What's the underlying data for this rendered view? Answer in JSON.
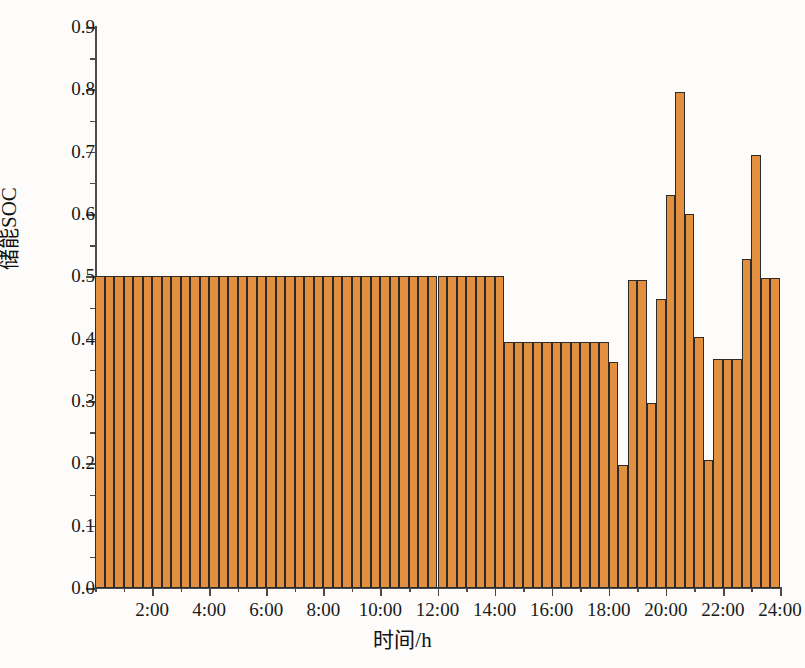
{
  "chart_data": {
    "type": "bar",
    "title": "",
    "xlabel": "时间/h",
    "ylabel": "储能SOC",
    "xlim": [
      0,
      24
    ],
    "ylim": [
      0.0,
      0.9
    ],
    "grid": false,
    "legend": null,
    "bar_color": "#e2903f",
    "bar_edge_color": "#2b2b2b",
    "axis_color": "#4a4a4a",
    "y_major_ticks": [
      "0.0",
      "0.1",
      "0.2",
      "0.3",
      "0.4",
      "0.5",
      "0.6",
      "0.7",
      "0.8",
      "0.9"
    ],
    "y_major_values": [
      0.0,
      0.1,
      0.2,
      0.3,
      0.4,
      0.5,
      0.6,
      0.7,
      0.8,
      0.9
    ],
    "y_minor_step": 0.05,
    "x_major_ticks": [
      "2:00",
      "4:00",
      "6:00",
      "8:00",
      "10:00",
      "12:00",
      "14:00",
      "16:00",
      "18:00",
      "20:00",
      "22:00",
      "24:00"
    ],
    "x_major_values": [
      2,
      4,
      6,
      8,
      10,
      12,
      14,
      16,
      18,
      20,
      22,
      24
    ],
    "x_minor_step": 1,
    "bar_interval_hours": 0.3333,
    "x": [
      0.333,
      0.667,
      1.0,
      1.333,
      1.667,
      2.0,
      2.333,
      2.667,
      3.0,
      3.333,
      3.667,
      4.0,
      4.333,
      4.667,
      5.0,
      5.333,
      5.667,
      6.0,
      6.333,
      6.667,
      7.0,
      7.333,
      7.667,
      8.0,
      8.333,
      8.667,
      9.0,
      9.333,
      9.667,
      10.0,
      10.333,
      10.667,
      11.0,
      11.333,
      11.667,
      12.0,
      12.333,
      12.667,
      13.0,
      13.333,
      13.667,
      14.0,
      14.333,
      14.667,
      15.0,
      15.333,
      15.667,
      16.0,
      16.333,
      16.667,
      17.0,
      17.333,
      17.667,
      18.0,
      18.333,
      18.667,
      19.0,
      19.333,
      19.667,
      20.0,
      20.333,
      20.667,
      21.0,
      21.333,
      21.667,
      22.0,
      22.333,
      22.667,
      23.0,
      23.333,
      23.667,
      24.0
    ],
    "values": [
      0.5,
      0.5,
      0.5,
      0.5,
      0.5,
      0.5,
      0.5,
      0.5,
      0.5,
      0.5,
      0.5,
      0.5,
      0.5,
      0.5,
      0.5,
      0.5,
      0.5,
      0.5,
      0.5,
      0.5,
      0.5,
      0.5,
      0.5,
      0.5,
      0.5,
      0.5,
      0.5,
      0.5,
      0.5,
      0.5,
      0.5,
      0.5,
      0.5,
      0.5,
      0.5,
      0.5,
      0.5,
      0.5,
      0.5,
      0.5,
      0.5,
      0.5,
      0.5,
      0.395,
      0.395,
      0.395,
      0.395,
      0.395,
      0.395,
      0.395,
      0.395,
      0.395,
      0.395,
      0.395,
      0.363,
      0.198,
      0.494,
      0.494,
      0.297,
      0.463,
      0.63,
      0.795,
      0.6,
      0.403,
      0.205,
      0.367,
      0.367,
      0.367,
      0.528,
      0.695,
      0.497,
      0.497
    ],
    "annotations": [
      {
        "time": "20:20",
        "value": 0.795,
        "note": "peak"
      },
      {
        "time": "23:20",
        "value": 0.695,
        "note": "secondary peak"
      },
      {
        "time": "18:40",
        "value": 0.198,
        "note": "minimum after discharge"
      },
      {
        "time": "21:40",
        "value": 0.205,
        "note": "second minimum"
      }
    ]
  }
}
